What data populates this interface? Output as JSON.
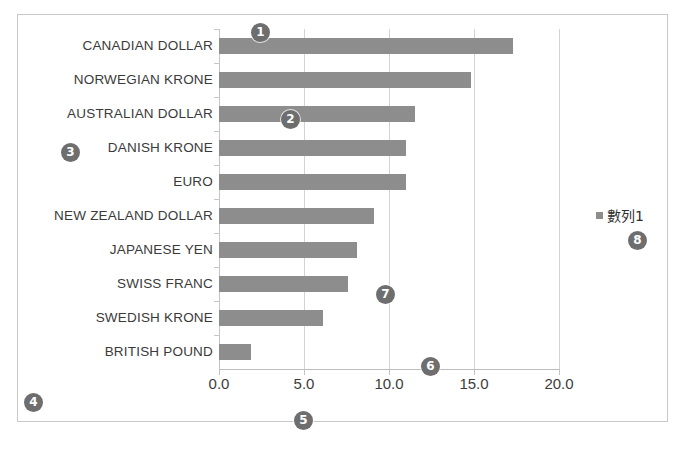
{
  "chart_data": {
    "type": "bar",
    "orientation": "horizontal",
    "title": "",
    "xlabel": "",
    "ylabel": "",
    "xlim": [
      0.0,
      20.0
    ],
    "xticks": [
      "0.0",
      "5.0",
      "10.0",
      "15.0",
      "20.0"
    ],
    "xtick_values": [
      0.0,
      5.0,
      10.0,
      15.0,
      20.0
    ],
    "grid": true,
    "legend_position": "right",
    "series": [
      {
        "name": "數列1",
        "color": "#8d8d8d",
        "values": [
          17.3,
          14.8,
          11.5,
          11.0,
          11.0,
          9.1,
          8.1,
          7.6,
          6.1,
          1.9
        ]
      }
    ],
    "categories": [
      "CANADIAN DOLLAR",
      "NORWEGIAN KRONE",
      "AUSTRALIAN DOLLAR",
      "DANISH KRONE",
      "EURO",
      "NEW ZEALAND DOLLAR",
      "JAPANESE YEN",
      "SWISS FRANC",
      "SWEDISH KRONE",
      "BRITISH POUND"
    ]
  },
  "legend": {
    "label": "數列1",
    "swatch_color": "#8d8d8d"
  },
  "markers": [
    {
      "id": "1",
      "label": "1",
      "x": 251,
      "y": 23
    },
    {
      "id": "2",
      "label": "2",
      "x": 281,
      "y": 110
    },
    {
      "id": "3",
      "label": "3",
      "x": 61,
      "y": 143
    },
    {
      "id": "4",
      "label": "4",
      "x": 24,
      "y": 393
    },
    {
      "id": "5",
      "label": "5",
      "x": 294,
      "y": 411
    },
    {
      "id": "6",
      "label": "6",
      "x": 421,
      "y": 357
    },
    {
      "id": "7",
      "label": "7",
      "x": 376,
      "y": 285
    },
    {
      "id": "8",
      "label": "8",
      "x": 628,
      "y": 231
    }
  ],
  "colors": {
    "bar": "#8d8d8d",
    "gridline": "#d3d3d3",
    "frame_border": "#c9c9c9",
    "marker_fill": "#6e6e6e",
    "text": "#3a3a3a"
  }
}
